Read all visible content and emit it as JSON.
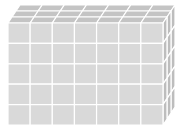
{
  "diagram": {
    "type": "cuboid-of-unit-cubes",
    "dimensions": {
      "columns": 7,
      "rows": 5,
      "depth": 3
    },
    "colors": {
      "front": "#d9d9d9",
      "top": "#c4c4c4",
      "side": "#bdbdbd",
      "grid": "#ffffff",
      "background": "#ffffff"
    }
  }
}
